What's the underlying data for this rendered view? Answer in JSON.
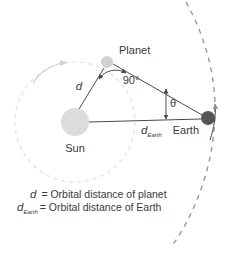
{
  "figure": {
    "bodies": {
      "sun": {
        "label": "Sun",
        "color": "#dcdcdc",
        "cx": 75,
        "cy": 122,
        "r": 14
      },
      "planet": {
        "label": "Planet",
        "color": "#d2d2d2",
        "cx": 107,
        "cy": 62,
        "r": 6
      },
      "earth": {
        "label": "Earth",
        "color": "#555555",
        "cx": 208,
        "cy": 118,
        "r": 7
      }
    },
    "angles": {
      "right_angle": "90°",
      "elongation": "θ"
    },
    "distances": {
      "planet_symbol": "d",
      "earth_symbol": "d",
      "earth_subscript": "Earth"
    },
    "orbits": {
      "planet_orbit_color": "#e2e2e2",
      "earth_orbit_color": "#9a9a9a"
    },
    "legend": [
      {
        "symbol": "d",
        "subscript": "",
        "text": "= Orbital distance of planet"
      },
      {
        "symbol": "d",
        "subscript": "Earth",
        "text": "= Orbital distance of Earth"
      }
    ]
  }
}
